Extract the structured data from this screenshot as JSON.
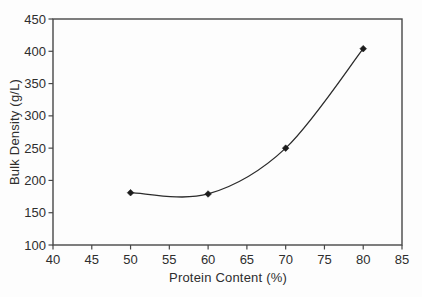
{
  "figure": {
    "background": "#fdfdfd"
  },
  "chart_data": {
    "type": "line",
    "title": "",
    "xlabel": "Protein Content (%)",
    "ylabel": "Bulk Density (g/L)",
    "series": [
      {
        "name": "bulk-density",
        "x": [
          50,
          60,
          70,
          80
        ],
        "y": [
          181,
          179,
          250,
          404
        ]
      }
    ],
    "xlim": [
      40,
      85
    ],
    "ylim": [
      100,
      450
    ],
    "x_ticks": [
      40,
      45,
      50,
      55,
      60,
      65,
      70,
      75,
      80,
      85
    ],
    "y_ticks": [
      100,
      150,
      200,
      250,
      300,
      350,
      400,
      450
    ],
    "grid": false,
    "legend": false,
    "smooth": true,
    "marker": "diamond",
    "colors": {
      "line": "#2b2b2b",
      "marker": "#1c1c1c",
      "frame": "#474747",
      "text": "#2e2e2e",
      "background": "#fdfdfd"
    }
  }
}
